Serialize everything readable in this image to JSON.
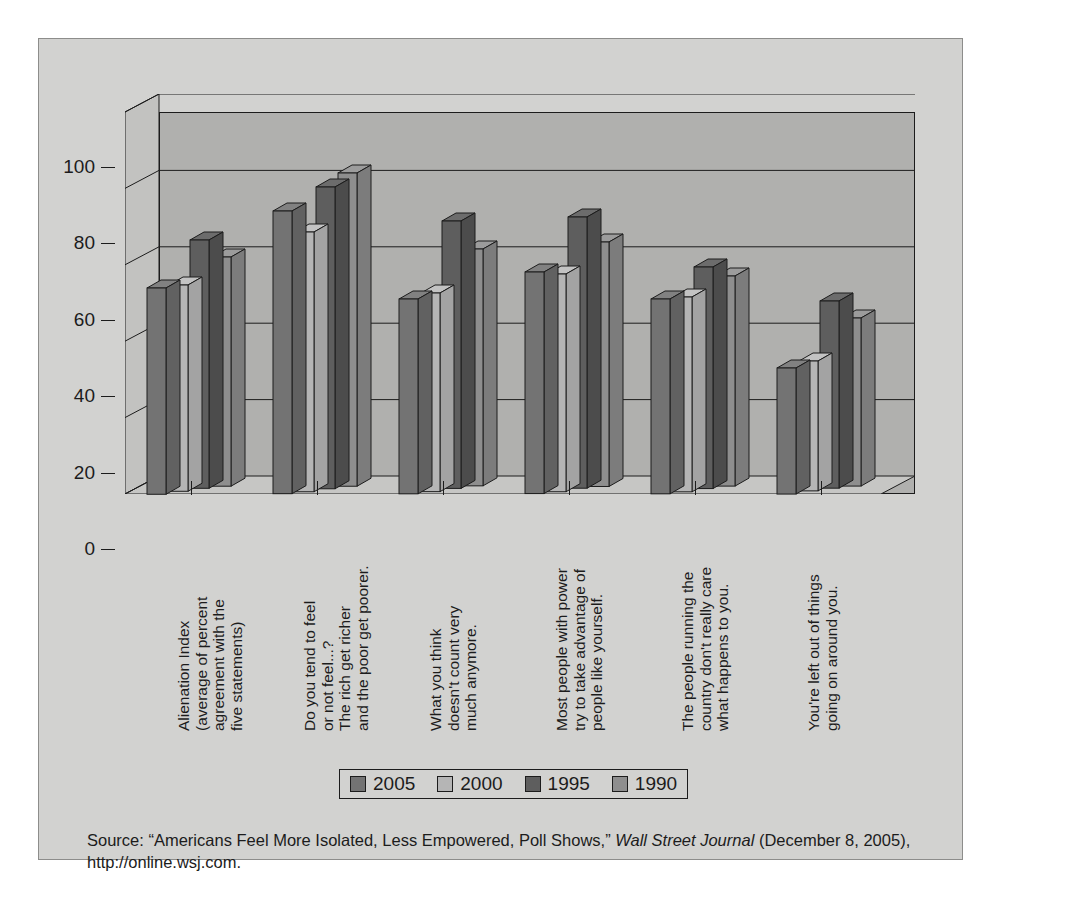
{
  "chart_data": {
    "type": "bar",
    "title": "",
    "xlabel": "",
    "ylabel": "",
    "ylim": [
      0,
      100
    ],
    "yticks": [
      0,
      20,
      40,
      60,
      80,
      100
    ],
    "grid": true,
    "legend_position": "bottom",
    "three_d": true,
    "categories": [
      "Alienation Index\n(average of percent\nagreement with the\nfive statements)",
      "Do you tend to feel\nor not feel...?\nThe rich get richer\nand the poor get poorer.",
      "What you think\ndoesn't count very\nmuch anymore.",
      "Most people with power\ntry to take advantage of\npeople like yourself.",
      "The people running the\ncountry don't really care\nwhat happens to you.",
      "You're left out of things\ngoing on around you."
    ],
    "series": [
      {
        "name": "2005",
        "color": "#737373",
        "values": [
          54,
          74,
          51,
          58,
          51,
          33
        ]
      },
      {
        "name": "2000",
        "color": "#b5b5b5",
        "values": [
          54,
          68,
          52,
          57,
          51,
          34
        ]
      },
      {
        "name": "1995",
        "color": "#5e5e5e",
        "values": [
          65,
          79,
          70,
          71,
          58,
          49
        ]
      },
      {
        "name": "1990",
        "color": "#8e8e8e",
        "values": [
          60,
          82,
          62,
          64,
          55,
          44
        ]
      }
    ]
  },
  "legend": {
    "items": [
      {
        "label": "2005",
        "color": "#737373"
      },
      {
        "label": "2000",
        "color": "#b5b5b5"
      },
      {
        "label": "1995",
        "color": "#5e5e5e"
      },
      {
        "label": "1990",
        "color": "#8e8e8e"
      }
    ]
  },
  "source": {
    "prefix": "Source: “Americans Feel More Isolated, Less Empowered, Poll Shows,” ",
    "publication": "Wall Street Journal",
    "suffix": " (December 8, 2005), http://online.wsj.com."
  }
}
